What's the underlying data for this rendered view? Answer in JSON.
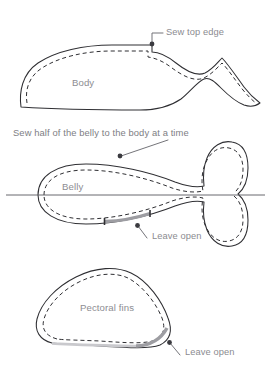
{
  "diagram": {
    "background_color": "#ffffff",
    "outline_color": "#2f2f33",
    "seam_color": "#2f2f33",
    "label_color": "#8b8b90",
    "open_edge_color": "#9d9da2",
    "leader_color": "#6d6d72"
  },
  "pieces": [
    {
      "id": "body",
      "label": "Body",
      "annotation": "Sew top edge",
      "seam_style": "dashed",
      "has_open_edge": false
    },
    {
      "id": "belly",
      "label": "Belly",
      "caption": "Sew half of the belly to the body at a time",
      "annotation": "Leave open",
      "seam_style": "dashed",
      "has_open_edge": true,
      "has_center_line": true
    },
    {
      "id": "pectoral-fins",
      "label": "Pectoral fins",
      "annotation": "Leave open",
      "seam_style": "dashed",
      "has_open_edge": true
    }
  ],
  "labels": {
    "sew_top_edge": "Sew top edge",
    "body": "Body",
    "belly_caption": "Sew half of the belly to the body at a time",
    "belly": "Belly",
    "leave_open_belly": "Leave open",
    "pectoral_fins": "Pectoral fins",
    "leave_open_fins": "Leave open"
  }
}
